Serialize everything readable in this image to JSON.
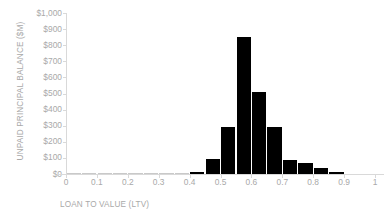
{
  "chart_data": {
    "type": "bar",
    "title": "",
    "xlabel": "LOAN TO VALUE (LTV)",
    "ylabel": "UNPAID PRINCIPAL BALANCE ($M)",
    "xlim": [
      0,
      1
    ],
    "ylim": [
      0,
      1000
    ],
    "grid": false,
    "legend": "none",
    "bar_width": 0.05,
    "x_tick_labels": [
      "0",
      "0.1",
      "0.2",
      "0.3",
      "0.4",
      "0.5",
      "0.6",
      "0.7",
      "0.8",
      "0.9",
      "1"
    ],
    "x_tick_values": [
      0,
      0.1,
      0.2,
      0.3,
      0.4,
      0.5,
      0.6,
      0.7,
      0.8,
      0.9,
      1
    ],
    "y_tick_labels": [
      "$0",
      "$100",
      "$200",
      "$300",
      "$400",
      "$500",
      "$600",
      "$700",
      "$800",
      "$900",
      "$1,000"
    ],
    "y_tick_values": [
      0,
      100,
      200,
      300,
      400,
      500,
      600,
      700,
      800,
      900,
      1000
    ],
    "categories": [
      0.0,
      0.05,
      0.1,
      0.15,
      0.2,
      0.25,
      0.3,
      0.35,
      0.4,
      0.45,
      0.5,
      0.55,
      0.6,
      0.65,
      0.7,
      0.75,
      0.8,
      0.85,
      0.9,
      0.95
    ],
    "values": [
      1,
      1,
      1,
      1,
      1,
      1,
      1,
      2,
      12,
      93,
      295,
      850,
      510,
      292,
      85,
      70,
      38,
      13,
      0,
      0
    ],
    "series": [
      {
        "name": "Unpaid Principal Balance",
        "values": [
          1,
          1,
          1,
          1,
          1,
          1,
          1,
          2,
          12,
          93,
          295,
          850,
          510,
          292,
          85,
          70,
          38,
          13,
          0,
          0
        ]
      }
    ],
    "colors": {
      "bar": "#000000",
      "axis": "#d9d9d9",
      "text": "#a9a9a9",
      "background": "#ffffff"
    }
  }
}
